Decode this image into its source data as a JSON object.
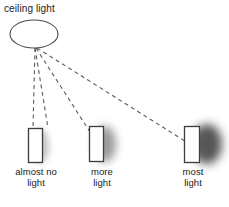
{
  "figure": {
    "background_color": "#ffffff",
    "ink_color": "#1b1b1b",
    "width": 229,
    "height": 207
  },
  "light_source": {
    "label": "ceiling light",
    "shape": "ellipse",
    "cx": 34,
    "cy": 34,
    "rx": 24,
    "ry": 14,
    "stroke": "#4a4a4a"
  },
  "rays": {
    "style": "dashed",
    "stroke": "#5a5a5a",
    "origin": {
      "x": 35,
      "y": 48
    },
    "count": 4,
    "endpoints": [
      {
        "x": 33,
        "y": 128
      },
      {
        "x": 47,
        "y": 128
      },
      {
        "x": 90,
        "y": 131
      },
      {
        "x": 188,
        "y": 143
      }
    ]
  },
  "objects": [
    {
      "name": "object-1",
      "label_lines": [
        "almost no",
        "light"
      ],
      "label_text": "almost no light",
      "rect": {
        "x": 28,
        "y": 128,
        "w": 14,
        "h": 34
      },
      "fill": "#ffffff",
      "stroke": "#3d3d3d",
      "shadow": {
        "intensity": "faint",
        "color": "#b9b9b9",
        "offset_x": 5,
        "blur": 7
      }
    },
    {
      "name": "object-2",
      "label_lines": [
        "more",
        "light"
      ],
      "label_text": "more light",
      "rect": {
        "x": 89,
        "y": 126,
        "w": 14,
        "h": 35
      },
      "fill": "#ffffff",
      "stroke": "#3d3d3d",
      "shadow": {
        "intensity": "medium",
        "color": "#8f8f8f",
        "offset_x": 8,
        "blur": 8
      }
    },
    {
      "name": "object-3",
      "label_lines": [
        "most",
        "light"
      ],
      "label_text": "most light",
      "rect": {
        "x": 184,
        "y": 126,
        "w": 15,
        "h": 36
      },
      "fill": "#ffffff",
      "stroke": "#3d3d3d",
      "shadow": {
        "intensity": "dark",
        "color": "#4e4e4e",
        "offset_x": 16,
        "blur": 9
      }
    }
  ],
  "bottom_caption": {
    "text": ""
  }
}
